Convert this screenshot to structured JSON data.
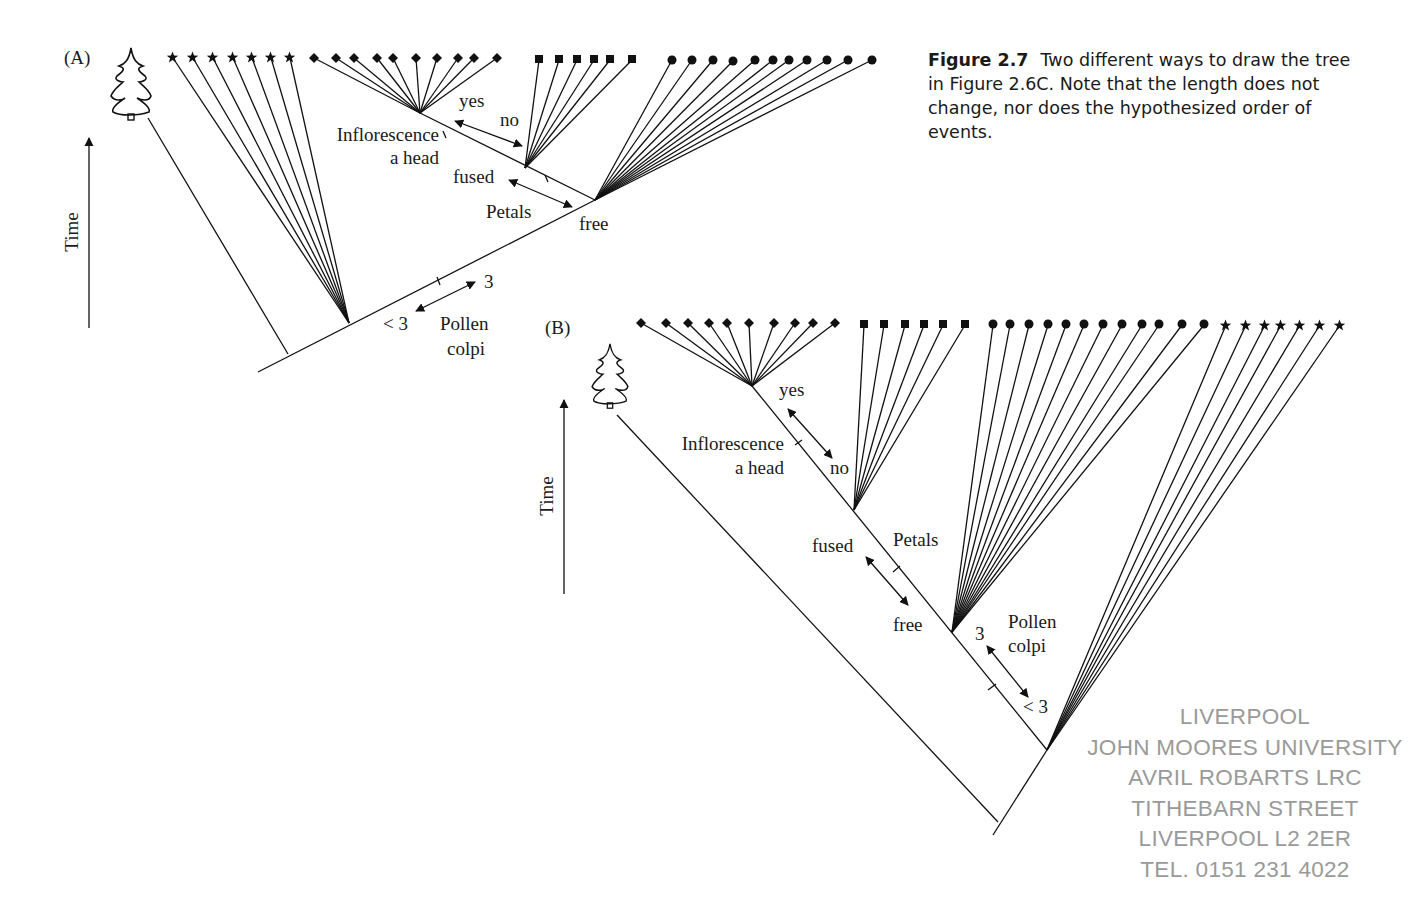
{
  "caption": {
    "figure_label": "Figure 2.7",
    "text": "Two different ways to draw the tree in Figure 2.6C. Note that the length does not change, nor does the hypothesized order of events."
  },
  "panel_a": {
    "label": "(A)",
    "axis_label": "Time",
    "taxa_groups": [
      {
        "symbol": "star",
        "count": 7
      },
      {
        "symbol": "diamond",
        "count": 10
      },
      {
        "symbol": "square",
        "count": 6
      },
      {
        "symbol": "circle",
        "count": 12
      }
    ],
    "characters": {
      "inflorescence": {
        "label_line1": "Inflorescence",
        "label_line2": "a head",
        "state_a": "yes",
        "state_b": "no"
      },
      "petals": {
        "label": "Petals",
        "state_a": "fused",
        "state_b": "free"
      },
      "pollen": {
        "label_line1": "Pollen",
        "label_line2": "colpi",
        "state_a": "3",
        "state_b": "< 3"
      }
    }
  },
  "panel_b": {
    "label": "(B)",
    "axis_label": "Time",
    "taxa_groups": [
      {
        "symbol": "diamond",
        "count": 10
      },
      {
        "symbol": "square",
        "count": 6
      },
      {
        "symbol": "circle",
        "count": 12
      },
      {
        "symbol": "star",
        "count": 7
      }
    ],
    "characters": {
      "inflorescence": {
        "label_line1": "Inflorescence",
        "label_line2": "a head",
        "state_a": "yes",
        "state_b": "no"
      },
      "petals": {
        "label": "Petals",
        "state_a": "fused",
        "state_b": "free"
      },
      "pollen": {
        "label_line1": "Pollen",
        "label_line2": "colpi",
        "state_a": "3",
        "state_b": "< 3"
      }
    }
  },
  "stamp": {
    "lines": [
      "LIVERPOOL",
      "JOHN MOORES UNIVERSITY",
      "AVRIL ROBARTS LRC",
      "TITHEBARN STREET",
      "LIVERPOOL L2 2ER",
      "TEL. 0151 231 4022"
    ]
  }
}
